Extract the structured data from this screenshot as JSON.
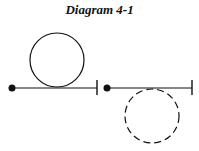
{
  "title": "Diagram 4-1",
  "figures": [
    {
      "name": "left",
      "dot": [
        12,
        88
      ],
      "line_end": 97,
      "circle": {
        "cx": 57,
        "cy": 60,
        "r": 27,
        "style": "solid"
      }
    },
    {
      "name": "right",
      "dot": [
        107,
        88
      ],
      "line_end": 192,
      "circle": {
        "cx": 152,
        "cy": 116,
        "r": 27,
        "style": "dashed"
      }
    }
  ]
}
